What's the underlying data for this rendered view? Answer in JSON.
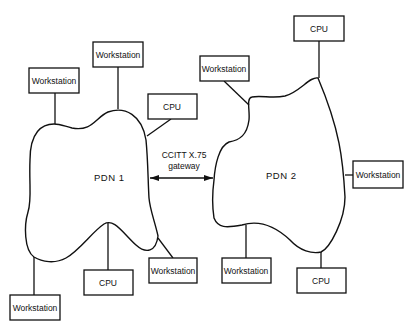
{
  "diagram": {
    "type": "network-topology",
    "networks": [
      {
        "id": "pdn1",
        "label": "PDN 1"
      },
      {
        "id": "pdn2",
        "label": "PDN 2"
      }
    ],
    "gateway": {
      "line1": "CCITT X.75",
      "line2": "gateway",
      "connects": [
        "pdn1",
        "pdn2"
      ],
      "bidirectional": true
    },
    "nodes": {
      "pdn1_ws_topleft": "Workstation",
      "pdn1_ws_top": "Workstation",
      "pdn1_cpu_topright": "CPU",
      "pdn1_ws_bottomleft": "Workstation",
      "pdn1_cpu_bottom": "CPU",
      "pdn1_ws_bottomright": "Workstation",
      "pdn2_ws_topleft": "Workstation",
      "pdn2_cpu_top": "CPU",
      "pdn2_ws_right": "Workstation",
      "pdn2_ws_bottom": "Workstation",
      "pdn2_cpu_bottom": "CPU"
    },
    "colors": {
      "stroke": "#111111",
      "background": "#ffffff"
    }
  }
}
